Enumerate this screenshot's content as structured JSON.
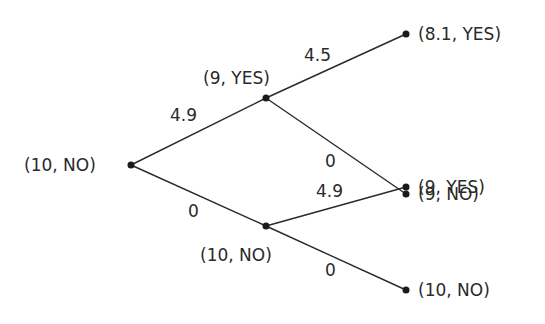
{
  "diagram": {
    "type": "decision-tree",
    "nodes": [
      {
        "id": "root",
        "label": "(10, NO)",
        "x": 131,
        "y": 165
      },
      {
        "id": "up",
        "label": "(9, YES)",
        "x": 266,
        "y": 98
      },
      {
        "id": "down",
        "label": "(10, NO)",
        "x": 266,
        "y": 226
      },
      {
        "id": "uu",
        "label": "(8.1, YES)",
        "x": 406,
        "y": 34
      },
      {
        "id": "ud",
        "label": "(9, NO)",
        "x": 406,
        "y": 194
      },
      {
        "id": "du",
        "label": "(9, YES)",
        "x": 406,
        "y": 187
      },
      {
        "id": "dd",
        "label": "(10, NO)",
        "x": 406,
        "y": 290
      }
    ],
    "edges": [
      {
        "from": "root",
        "to": "up",
        "weight": "4.9"
      },
      {
        "from": "root",
        "to": "down",
        "weight": "0"
      },
      {
        "from": "up",
        "to": "uu",
        "weight": "4.5"
      },
      {
        "from": "up",
        "to": "ud",
        "weight": "0"
      },
      {
        "from": "down",
        "to": "du",
        "weight": "4.9"
      },
      {
        "from": "down",
        "to": "dd",
        "weight": "0"
      }
    ]
  }
}
